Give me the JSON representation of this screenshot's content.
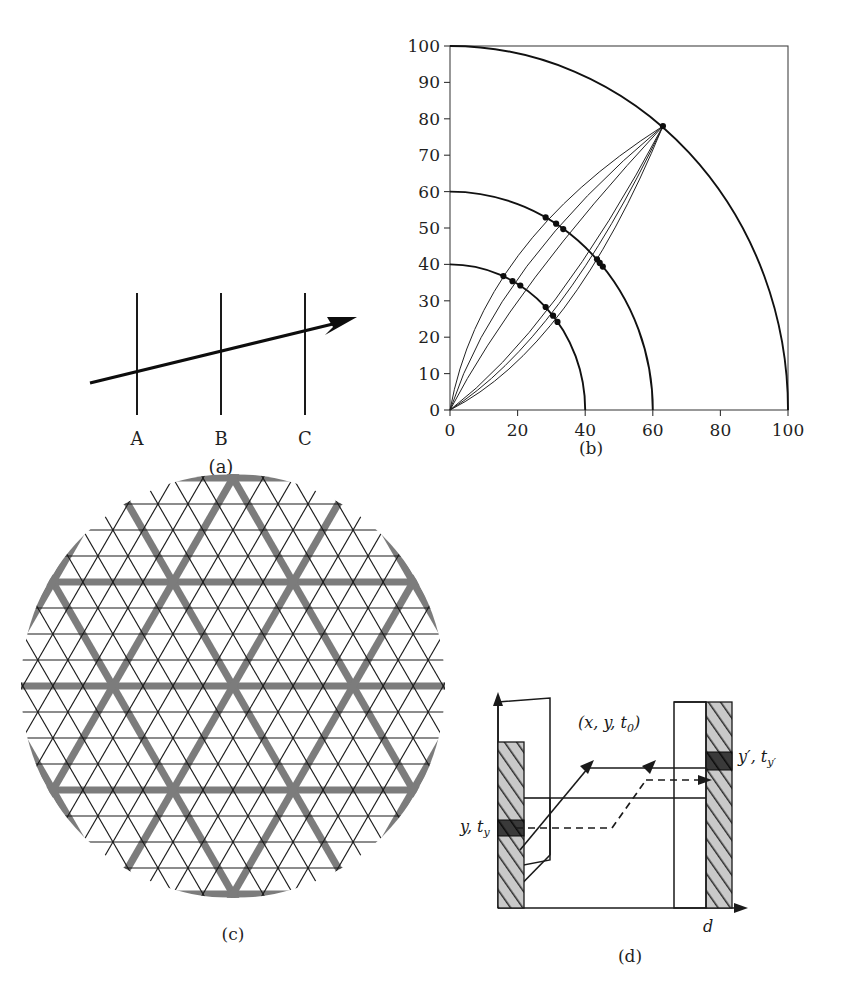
{
  "figure": {
    "panels": [
      {
        "id": "a",
        "caption": "(a)"
      },
      {
        "id": "b",
        "caption": "(b)"
      },
      {
        "id": "c",
        "caption": "(c)"
      },
      {
        "id": "d",
        "caption": "(d)"
      }
    ]
  },
  "panel_a": {
    "caption": "(a)",
    "line_labels": [
      "A",
      "B",
      "C"
    ],
    "label_a": "A",
    "label_b": "B",
    "label_c": "C"
  },
  "panel_c": {
    "caption": "(c)",
    "description": "triangular lattice",
    "thin_line_color": "#1b1b1b",
    "thick_line_color": "#7c7c7c",
    "line_families": 3,
    "family_angles_deg": [
      0,
      60,
      120
    ],
    "thick_every_n": 4
  },
  "panel_d": {
    "caption": "(d)",
    "label_source": "y, t",
    "label_source_sub": "y",
    "label_target": "y′, t",
    "label_target_sub": "y′",
    "label_point_prefix": "(x, y, t",
    "label_point_sub": "0",
    "label_point_suffix": ")",
    "label_distance": "d",
    "plane_fill": "#c9c9c9",
    "band_fill": "#3a3a3a"
  },
  "chart_data": {
    "type": "line",
    "title": "",
    "caption": "(b)",
    "xlabel": "",
    "ylabel": "",
    "xlim": [
      0,
      100
    ],
    "ylim": [
      0,
      100
    ],
    "grid": false,
    "legend": "none",
    "xticks": [
      0,
      20,
      40,
      60,
      80,
      100
    ],
    "yticks": [
      0,
      10,
      20,
      30,
      40,
      50,
      60,
      70,
      80,
      90,
      100
    ],
    "xtick_labels": [
      "0",
      "20",
      "40",
      "60",
      "80",
      "100"
    ],
    "ytick_labels": [
      "0",
      "10",
      "20",
      "30",
      "40",
      "50",
      "60",
      "70",
      "80",
      "90",
      "100"
    ],
    "arcs": [
      {
        "name": "arc-r40",
        "radius": 40,
        "center": [
          0,
          0
        ]
      },
      {
        "name": "arc-r60",
        "radius": 60,
        "center": [
          0,
          0
        ]
      },
      {
        "name": "arc-r100",
        "radius": 100,
        "center": [
          0,
          0
        ]
      }
    ],
    "apex_point": [
      63,
      78
    ],
    "series": [
      {
        "name": "ray-1",
        "start": [
          0,
          0
        ],
        "end": [
          63,
          78
        ],
        "control": [
          9,
          46
        ],
        "markers": [
          {
            "x": 15.8,
            "y": 36.8,
            "radius": 40
          },
          {
            "x": 28.3,
            "y": 52.9,
            "radius": 60
          }
        ]
      },
      {
        "name": "ray-2",
        "start": [
          0,
          0
        ],
        "end": [
          63,
          78
        ],
        "control": [
          14,
          40
        ],
        "markers": [
          {
            "x": 18.5,
            "y": 35.4,
            "radius": 40
          },
          {
            "x": 31.4,
            "y": 51.2,
            "radius": 60
          }
        ]
      },
      {
        "name": "ray-3",
        "start": [
          0,
          0
        ],
        "end": [
          63,
          78
        ],
        "control": [
          19,
          34
        ],
        "markers": [
          {
            "x": 20.8,
            "y": 34.2,
            "radius": 40
          },
          {
            "x": 33.5,
            "y": 49.7,
            "radius": 60
          }
        ]
      },
      {
        "name": "ray-4",
        "start": [
          0,
          0
        ],
        "end": [
          63,
          78
        ],
        "control": [
          31,
          22
        ],
        "markers": [
          {
            "x": 28.3,
            "y": 28.3,
            "radius": 40
          },
          {
            "x": 43.5,
            "y": 41.4,
            "radius": 60
          }
        ]
      },
      {
        "name": "ray-5",
        "start": [
          0,
          0
        ],
        "end": [
          63,
          78
        ],
        "control": [
          36,
          17
        ],
        "markers": [
          {
            "x": 30.5,
            "y": 25.9,
            "radius": 40
          },
          {
            "x": 45.2,
            "y": 39.4,
            "radius": 60
          }
        ]
      },
      {
        "name": "ray-6",
        "start": [
          0,
          0
        ],
        "end": [
          63,
          78
        ],
        "control": [
          33,
          19.5
        ],
        "markers": [
          {
            "x": 31.8,
            "y": 24.2,
            "radius": 40
          },
          {
            "x": 44.3,
            "y": 40.4,
            "radius": 60
          }
        ]
      }
    ],
    "marker_points": [
      [
        15.8,
        36.8
      ],
      [
        18.5,
        35.4
      ],
      [
        20.8,
        34.2
      ],
      [
        28.3,
        28.3
      ],
      [
        30.5,
        25.9
      ],
      [
        31.8,
        24.2
      ],
      [
        28.3,
        52.9
      ],
      [
        31.4,
        51.2
      ],
      [
        33.5,
        49.7
      ],
      [
        43.5,
        41.4
      ],
      [
        44.3,
        40.4
      ],
      [
        45.2,
        39.4
      ],
      [
        63,
        78
      ]
    ]
  }
}
